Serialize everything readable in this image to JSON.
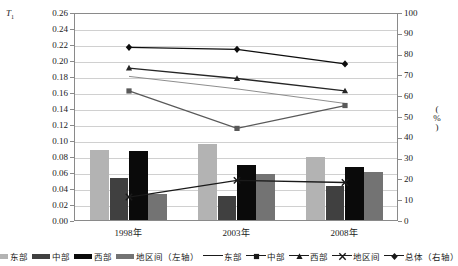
{
  "chart_data": {
    "type": "bar",
    "title": "",
    "subtitle": "",
    "categories": [
      "1998年",
      "2003年",
      "2008年"
    ],
    "xlabel": "",
    "ylabel": "T1",
    "ylabel_display": "T",
    "ylabel_sub": "1",
    "ylim": [
      0.0,
      0.26
    ],
    "y_ticks": [
      "0.00",
      "0.02",
      "0.04",
      "0.06",
      "0.08",
      "0.10",
      "0.12",
      "0.14",
      "0.16",
      "0.18",
      "0.20",
      "0.22",
      "0.24",
      "0.26"
    ],
    "y2label": "(%)",
    "y2lim": [
      0,
      100
    ],
    "y2_ticks": [
      "0",
      "10",
      "20",
      "30",
      "40",
      "50",
      "60",
      "70",
      "80",
      "90",
      "100"
    ],
    "grid": true,
    "legend_position": "bottom",
    "bar_series": [
      {
        "name": "东部",
        "axis": "left",
        "color": "#b3b3b3",
        "values": [
          0.087,
          0.095,
          0.079
        ]
      },
      {
        "name": "中部",
        "axis": "left",
        "color": "#404040",
        "values": [
          0.053,
          0.03,
          0.043
        ]
      },
      {
        "name": "西部",
        "axis": "left",
        "color": "#0a0a0a",
        "values": [
          0.086,
          0.069,
          0.066
        ]
      },
      {
        "name": "地区间（左轴）",
        "axis": "left",
        "color": "#737373",
        "values": [
          0.033,
          0.058,
          0.06
        ]
      }
    ],
    "line_series": [
      {
        "name": "东部",
        "axis": "right",
        "marker": "none",
        "color": "#808080",
        "values": [
          70,
          64,
          57
        ]
      },
      {
        "name": "中部",
        "axis": "right",
        "marker": "square",
        "color": "#595959",
        "values": [
          63,
          45,
          56
        ]
      },
      {
        "name": "西部",
        "axis": "right",
        "marker": "triangle",
        "color": "#262626",
        "values": [
          74,
          69,
          63
        ]
      },
      {
        "name": "地区间",
        "axis": "right",
        "marker": "x",
        "color": "#1a1a1a",
        "values": [
          12,
          20,
          19
        ]
      },
      {
        "name": "总体（右轴）",
        "axis": "right",
        "marker": "diamond",
        "color": "#0d0d0d",
        "values": [
          84,
          83,
          76
        ]
      }
    ]
  },
  "legend": {
    "items": [
      {
        "label": "东部",
        "kind": "swatch",
        "color": "#b3b3b3"
      },
      {
        "label": "中部",
        "kind": "swatch",
        "color": "#404040"
      },
      {
        "label": "西部",
        "kind": "swatch",
        "color": "#0a0a0a"
      },
      {
        "label": "地区间（左轴）",
        "kind": "swatch",
        "color": "#737373"
      },
      {
        "label": "东部",
        "kind": "line",
        "marker": "none"
      },
      {
        "label": "中部",
        "kind": "line",
        "marker": "square"
      },
      {
        "label": "西部",
        "kind": "line",
        "marker": "triangle"
      },
      {
        "label": "地区间",
        "kind": "line",
        "marker": "x"
      },
      {
        "label": "总体（右轴）",
        "kind": "line",
        "marker": "diamond"
      }
    ]
  }
}
